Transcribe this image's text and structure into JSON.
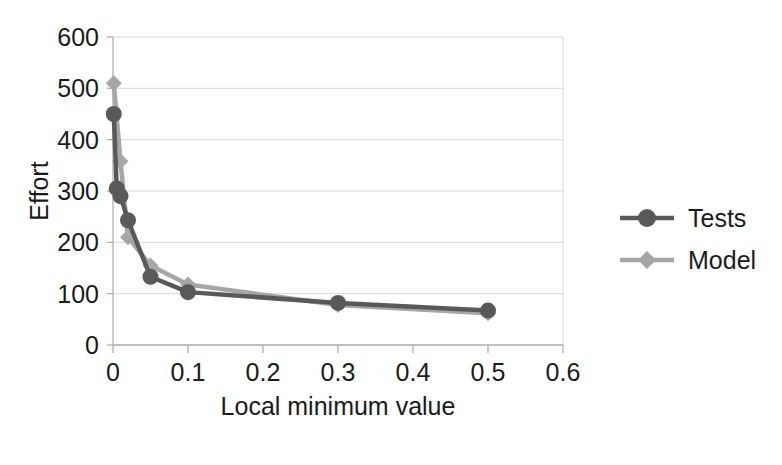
{
  "chart_data": {
    "type": "line",
    "title": "",
    "subtitle": "",
    "xlabel": "Local minimum value",
    "ylabel": "Effort",
    "xlim": [
      0,
      0.6
    ],
    "ylim": [
      0,
      600
    ],
    "xticks": [
      "0",
      "0.1",
      "0.2",
      "0.3",
      "0.4",
      "0.5",
      "0.6"
    ],
    "xtick_values": [
      0,
      0.1,
      0.2,
      0.3,
      0.4,
      0.5,
      0.6
    ],
    "yticks": [
      "0",
      "100",
      "200",
      "300",
      "400",
      "500",
      "600"
    ],
    "ytick_values": [
      0,
      100,
      200,
      300,
      400,
      500,
      600
    ],
    "grid": "horizontal",
    "legend_position": "right",
    "series": [
      {
        "name": "Tests",
        "color": "#595959",
        "marker": "circle",
        "x": [
          0.001,
          0.005,
          0.01,
          0.02,
          0.05,
          0.1,
          0.3,
          0.5
        ],
        "values": [
          450,
          305,
          290,
          243,
          133,
          103,
          82,
          67
        ]
      },
      {
        "name": "Model",
        "color": "#a6a6a6",
        "marker": "diamond",
        "x": [
          0.001,
          0.01,
          0.02,
          0.05,
          0.1,
          0.3,
          0.5
        ],
        "values": [
          510,
          358,
          210,
          155,
          118,
          78,
          62
        ]
      }
    ]
  },
  "legend": {
    "items": [
      {
        "label": "Tests",
        "color": "#595959",
        "marker": "circle"
      },
      {
        "label": "Model",
        "color": "#a6a6a6",
        "marker": "diamond"
      }
    ]
  },
  "axes": {
    "x_title": "Local minimum value",
    "y_title": "Effort"
  }
}
